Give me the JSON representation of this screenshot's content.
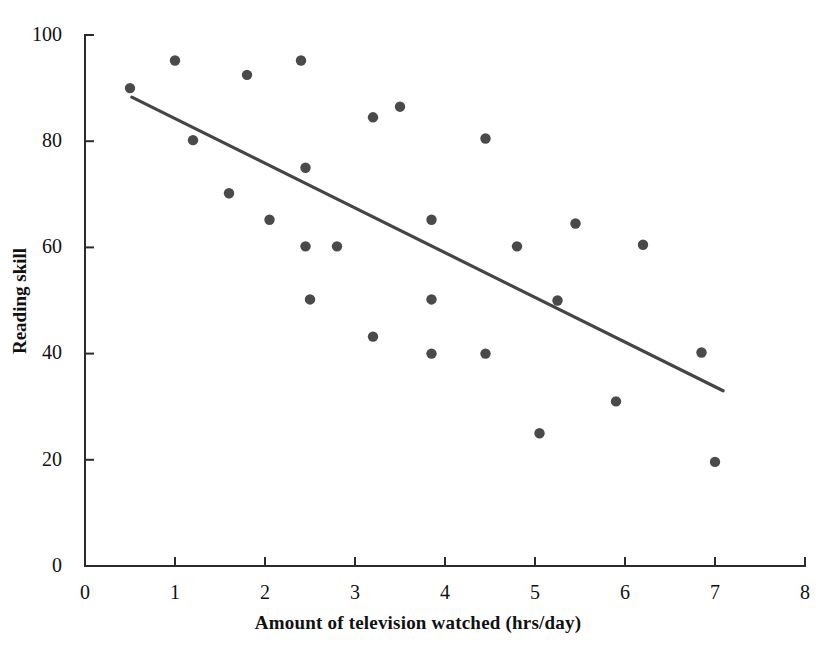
{
  "chart_data": {
    "type": "scatter",
    "title": "",
    "xlabel": "Amount of television watched (hrs/day)",
    "ylabel": "Reading skill",
    "xlim": [
      0,
      8
    ],
    "ylim": [
      0,
      100
    ],
    "xticks": [
      "0",
      "1",
      "2",
      "3",
      "4",
      "5",
      "6",
      "7",
      "8"
    ],
    "xtick_values": [
      0,
      1,
      2,
      3,
      4,
      5,
      6,
      7,
      8
    ],
    "yticks": [
      "0",
      "20",
      "40",
      "60",
      "80",
      "100"
    ],
    "ytick_values": [
      0,
      20,
      40,
      60,
      80,
      100
    ],
    "grid": false,
    "legend": false,
    "point_color": "#4a4a4a",
    "line_color": "#454545",
    "axis_color": "#2b2b2b",
    "points": [
      {
        "x": 0.5,
        "y": 90.0
      },
      {
        "x": 1.0,
        "y": 95.2
      },
      {
        "x": 1.2,
        "y": 80.2
      },
      {
        "x": 1.6,
        "y": 70.2
      },
      {
        "x": 1.8,
        "y": 92.5
      },
      {
        "x": 2.05,
        "y": 65.2
      },
      {
        "x": 2.4,
        "y": 95.2
      },
      {
        "x": 2.45,
        "y": 75.0
      },
      {
        "x": 2.45,
        "y": 60.2
      },
      {
        "x": 2.5,
        "y": 50.2
      },
      {
        "x": 2.8,
        "y": 60.2
      },
      {
        "x": 3.2,
        "y": 84.5
      },
      {
        "x": 3.2,
        "y": 43.2
      },
      {
        "x": 3.5,
        "y": 86.5
      },
      {
        "x": 3.85,
        "y": 65.2
      },
      {
        "x": 3.85,
        "y": 50.2
      },
      {
        "x": 3.85,
        "y": 40.0
      },
      {
        "x": 4.45,
        "y": 80.5
      },
      {
        "x": 4.45,
        "y": 40.0
      },
      {
        "x": 4.8,
        "y": 60.2
      },
      {
        "x": 5.05,
        "y": 25.0
      },
      {
        "x": 5.25,
        "y": 50.0
      },
      {
        "x": 5.45,
        "y": 64.5
      },
      {
        "x": 5.9,
        "y": 31.0
      },
      {
        "x": 6.2,
        "y": 60.5
      },
      {
        "x": 6.85,
        "y": 40.2
      },
      {
        "x": 7.0,
        "y": 19.6
      }
    ],
    "trend_line": {
      "x0": 0.52,
      "y0": 88.3,
      "x1": 7.09,
      "y1": 33.0,
      "description": "least-squares regression line, negative slope"
    },
    "annotations": []
  }
}
